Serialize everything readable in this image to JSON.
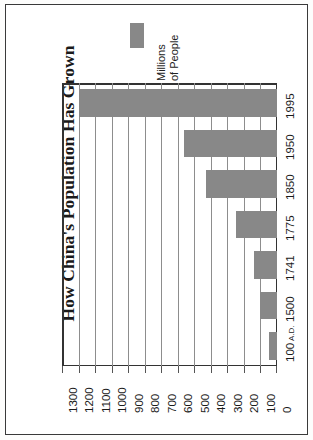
{
  "chart_data": {
    "type": "bar",
    "orientation": "horizontal",
    "title": "How China's Population Has Grown",
    "xlabel": "",
    "ylabel": "",
    "legend": {
      "position": "top",
      "entries": [
        {
          "label_lines": [
            "Millions",
            "of People"
          ],
          "color": "#888888"
        }
      ]
    },
    "categories": [
      "1995",
      "1950",
      "1850",
      "1775",
      "1741",
      "1500",
      "100 A.D."
    ],
    "category_suffixes": [
      "",
      "",
      "",
      "",
      "",
      "",
      " A.D."
    ],
    "values": [
      1200,
      560,
      430,
      250,
      140,
      100,
      50
    ],
    "value_unit": "millions of people",
    "xlim": [
      0,
      1300
    ],
    "tick_labels": [
      "1300",
      "1200",
      "1100",
      "1000",
      "900",
      "800",
      "700",
      "600",
      "500",
      "400",
      "300",
      "200",
      "100",
      "0"
    ],
    "tick_values": [
      1300,
      1200,
      1100,
      1000,
      900,
      800,
      700,
      600,
      500,
      400,
      300,
      200,
      100,
      0
    ],
    "grid": true,
    "grid_axis": "value",
    "colors": {
      "bar": "#888888",
      "gridline": "#8d8d8d",
      "axis": "#333333",
      "frame": "#3a3a3a",
      "background": "#ffffff",
      "text": "#1a1a1a"
    }
  }
}
